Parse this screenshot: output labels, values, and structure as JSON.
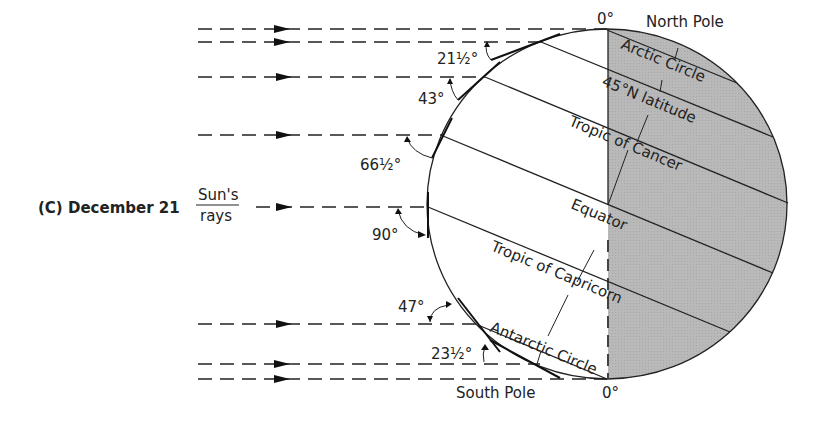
{
  "figure": {
    "panel_label": "(C)",
    "date": "December 21",
    "rays_label_top": "Sun's",
    "rays_label_bottom": "rays"
  },
  "poles": {
    "north": "North Pole",
    "south": "South Pole",
    "north_angle": "0°",
    "south_angle": "0°"
  },
  "latitude_lines": [
    {
      "name": "Arctic Circle"
    },
    {
      "name": "45°N latitude"
    },
    {
      "name": "Tropic of Cancer"
    },
    {
      "name": "Equator"
    },
    {
      "name": "Tropic of Capricorn"
    },
    {
      "name": "Antarctic Circle"
    }
  ],
  "sun_angles": [
    {
      "label": "21½°",
      "at": "Arctic Circle ray"
    },
    {
      "label": "43°",
      "at": "45°N latitude ray"
    },
    {
      "label": "66½°",
      "at": "Tropic of Cancer ray"
    },
    {
      "label": "90°",
      "at": "Tropic of Capricorn ray"
    },
    {
      "label": "47°",
      "at": "Antarctic Circle ray (upper)"
    },
    {
      "label": "23½°",
      "at": "Antarctic region ray"
    }
  ],
  "colors": {
    "night_shade": "#b8b8b8",
    "ink": "#222222"
  }
}
